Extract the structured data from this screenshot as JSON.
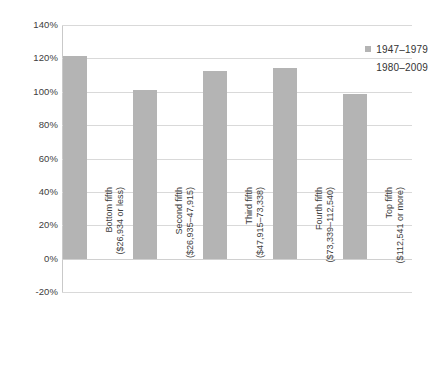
{
  "chart_data": {
    "type": "bar",
    "title": "",
    "subtitle": "",
    "xlabel": "",
    "ylabel": "",
    "ylim": [
      -20,
      140
    ],
    "ytick_step": 20,
    "ytick_labels": [
      "140%",
      "120%",
      "100%",
      "80%",
      "60%",
      "40%",
      "20%",
      "0%",
      "-20%"
    ],
    "ytick_values": [
      140,
      120,
      100,
      80,
      60,
      40,
      20,
      0,
      -20
    ],
    "grid": true,
    "legend_position": "top-right-inside",
    "categories": [
      {
        "line1": "Bottom fifth",
        "line2": "($26,934 or less)"
      },
      {
        "line1": "Second fifth",
        "line2": "($26,935–47,915)"
      },
      {
        "line1": "Third fifth",
        "line2": "($47,915–73,338)"
      },
      {
        "line1": "Fourth fifth",
        "line2": "($73,339–112,540)"
      },
      {
        "line1": "Top fifth",
        "line2": "($112,541 or more)"
      }
    ],
    "series": [
      {
        "name": "1947–1979",
        "color": "#b4b4b4",
        "values": [
          121.5,
          101,
          112.5,
          114.5,
          98.5
        ]
      },
      {
        "name": "1980–2009",
        "color": "#ffffff",
        "values": [
          0,
          0,
          0,
          0,
          0
        ]
      }
    ]
  },
  "legend": {
    "entries": [
      {
        "label": "1947–1979",
        "swatch": "filled"
      },
      {
        "label": "1980–2009",
        "swatch": "blank"
      }
    ]
  },
  "colors": {
    "bar_primary": "#b4b4b4",
    "gridline": "#d9d9d9",
    "axis": "#c9c9c9",
    "text": "#3a3a3a",
    "background": "#ffffff"
  }
}
